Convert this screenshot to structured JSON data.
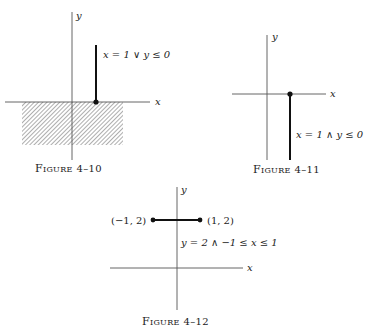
{
  "figures": [
    {
      "id": "fig-4-10",
      "caption": "Figure 4–10",
      "caption_small": "IGURE",
      "caption_first": "F",
      "caption_num": "4–10",
      "axes": {
        "x_label": "x",
        "y_label": "y"
      },
      "condition": "x = 1 ∨ y ≤ 0",
      "region": "lower half-plane shaded plus vertical ray x = 1, y ≥ 0"
    },
    {
      "id": "fig-4-11",
      "caption": "Figure 4–11",
      "caption_small": "IGURE",
      "caption_first": "F",
      "caption_num": "4–11",
      "axes": {
        "x_label": "x",
        "y_label": "y"
      },
      "condition": "x = 1 ∧ y ≤ 0",
      "region": "vertical ray x = 1, y ≤ 0 with endpoint at (1, 0)"
    },
    {
      "id": "fig-4-12",
      "caption": "Figure 4–12",
      "caption_small": "IGURE",
      "caption_first": "F",
      "caption_num": "4–12",
      "axes": {
        "x_label": "x",
        "y_label": "y"
      },
      "condition": "y = 2 ∧ −1 ≤ x ≤ 1",
      "endpoints": [
        "(−1, 2)",
        "(1, 2)"
      ],
      "region": "horizontal segment from (−1, 2) to (1, 2)"
    }
  ],
  "colors": {
    "ink": "#1a1a1a",
    "axis": "#555555",
    "hatch": "#6a6a6a"
  }
}
